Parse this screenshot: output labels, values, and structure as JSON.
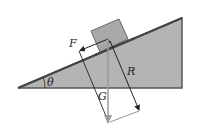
{
  "diagram": {
    "labels": {
      "friction": "F",
      "reaction": "R",
      "gravity": "G",
      "angle": "θ"
    },
    "colors": {
      "incline_fill": "#b4b4b4",
      "incline_stroke": "#555555",
      "block_fill": "#a8a8a8",
      "block_stroke": "#555555",
      "arrow_dark": "#222222",
      "arrow_gravity": "#9a9a9a",
      "construction_line": "#888888"
    },
    "elements": [
      {
        "id": "incline",
        "type": "right-triangle"
      },
      {
        "id": "block",
        "type": "rotated-square"
      },
      {
        "id": "force-F",
        "label": "F",
        "direction": "up-slope"
      },
      {
        "id": "force-G",
        "label": "G",
        "direction": "vertical-down"
      },
      {
        "id": "force-R",
        "label": "R",
        "direction": "resultant"
      },
      {
        "id": "angle-theta",
        "label": "θ"
      }
    ]
  }
}
